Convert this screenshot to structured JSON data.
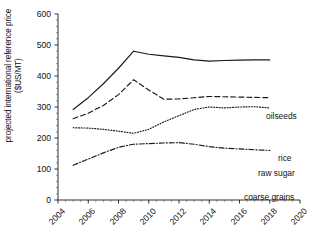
{
  "chart_data": {
    "type": "line",
    "title": "",
    "xlabel": "",
    "ylabel": "projected international reference price ($US/MT)",
    "xlim": [
      2004,
      2020
    ],
    "ylim": [
      0,
      600
    ],
    "ytick_labels": [
      "0",
      "100",
      "200",
      "300",
      "400",
      "500",
      "600"
    ],
    "ytick_values": [
      0,
      100,
      200,
      300,
      400,
      500,
      600
    ],
    "xtick_labels": [
      "2004",
      "2006",
      "2008",
      "2010",
      "2012",
      "2014",
      "2016",
      "2018",
      "2020"
    ],
    "xtick_values": [
      2004,
      2006,
      2008,
      2010,
      2012,
      2014,
      2016,
      2018,
      2020
    ],
    "minor_xticks": true,
    "minor_yticks": true,
    "grid": false,
    "legend_position": "right-inline",
    "x": [
      2005,
      2006,
      2007,
      2008,
      2009,
      2010,
      2011,
      2012,
      2013,
      2014,
      2015,
      2016,
      2017,
      2018
    ],
    "series": [
      {
        "name": "oilseeds",
        "style": "solid",
        "color": "#1a1a1a",
        "values": [
          292,
          330,
          375,
          425,
          480,
          470,
          465,
          460,
          452,
          448,
          450,
          451,
          452,
          452
        ]
      },
      {
        "name": "rice",
        "style": "dashed",
        "color": "#1a1a1a",
        "values": [
          262,
          280,
          305,
          340,
          388,
          355,
          325,
          326,
          330,
          334,
          333,
          332,
          331,
          330
        ]
      },
      {
        "name": "raw sugar",
        "style": "dotted",
        "color": "#1a1a1a",
        "values": [
          233,
          232,
          228,
          222,
          215,
          228,
          252,
          272,
          292,
          300,
          297,
          300,
          301,
          297
        ]
      },
      {
        "name": "coarse grains",
        "style": "dashdot",
        "color": "#1a1a1a",
        "values": [
          112,
          132,
          152,
          170,
          180,
          182,
          184,
          185,
          180,
          172,
          167,
          165,
          162,
          160
        ]
      }
    ]
  },
  "legend": {
    "items": [
      {
        "label": "oilseeds",
        "style": "solid"
      },
      {
        "label": "rice",
        "style": "dashed"
      },
      {
        "label": "raw sugar",
        "style": "dotted"
      },
      {
        "label": "coarse grains",
        "style": "dashdot"
      }
    ]
  },
  "axis": {
    "y_title": "projected international reference price ($US/MT)"
  }
}
